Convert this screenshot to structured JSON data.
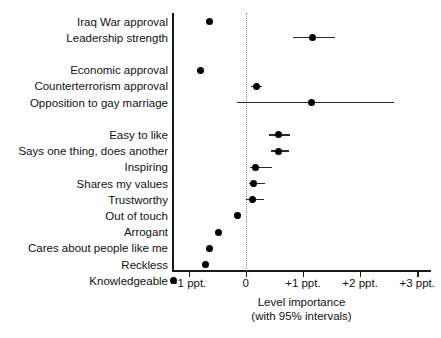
{
  "chart_data": {
    "type": "scatter",
    "title": "",
    "xlabel": "Level importance",
    "xlabel_sub": "(with 95% intervals)",
    "ylabel": "",
    "xlim": [
      -1.29,
      3.24
    ],
    "grid": false,
    "zero_reference_line": 0,
    "legend": "none",
    "xticks": [
      -1,
      0,
      1,
      2,
      3
    ],
    "xtick_labels": [
      "−1 ppt.",
      "0",
      "+1 ppt.",
      "+2 ppt.",
      "+3 ppt."
    ],
    "categories": [
      "Iraq War approval",
      "Leadership strength",
      "Economic approval",
      "Counterterrorism approval",
      "Opposition to gay marriage",
      "Easy to like",
      "Says one thing, does another",
      "Inspiring",
      "Shares my values",
      "Trustworthy",
      "Out of touch",
      "Arrogant",
      "Cares about people like me",
      "Reckless",
      "Knowledgeable"
    ],
    "points": [
      {
        "label": "Iraq War approval",
        "estimate": -0.64,
        "ci_low": -0.69,
        "ci_high": -0.59,
        "row": 0
      },
      {
        "label": "Leadership strength",
        "estimate": 1.17,
        "ci_low": 0.82,
        "ci_high": 1.56,
        "row": 1
      },
      {
        "label": "Economic approval",
        "estimate": -0.8,
        "ci_low": -0.85,
        "ci_high": -0.75,
        "row": 3
      },
      {
        "label": "Counterterrorism approval",
        "estimate": 0.19,
        "ci_low": 0.1,
        "ci_high": 0.28,
        "row": 4
      },
      {
        "label": "Opposition to gay marriage",
        "estimate": 1.15,
        "ci_low": -0.15,
        "ci_high": 2.59,
        "row": 5
      },
      {
        "label": "Easy to like",
        "estimate": 0.57,
        "ci_low": 0.41,
        "ci_high": 0.78,
        "row": 7
      },
      {
        "label": "Says one thing, does another",
        "estimate": 0.58,
        "ci_low": 0.44,
        "ci_high": 0.76,
        "row": 8
      },
      {
        "label": "Inspiring",
        "estimate": 0.17,
        "ci_low": 0.07,
        "ci_high": 0.46,
        "row": 9
      },
      {
        "label": "Shares my values",
        "estimate": 0.14,
        "ci_low": 0.05,
        "ci_high": 0.34,
        "row": 10
      },
      {
        "label": "Trustworthy",
        "estimate": 0.11,
        "ci_low": 0.01,
        "ci_high": 0.32,
        "row": 11
      },
      {
        "label": "Out of touch",
        "estimate": -0.15,
        "ci_low": -0.19,
        "ci_high": -0.11,
        "row": 12
      },
      {
        "label": "Arrogant",
        "estimate": -0.48,
        "ci_low": -0.52,
        "ci_high": -0.44,
        "row": 13
      },
      {
        "label": "Cares about people like me",
        "estimate": -0.64,
        "ci_low": -0.68,
        "ci_high": -0.6,
        "row": 14
      },
      {
        "label": "Reckless",
        "estimate": -0.7,
        "ci_low": -0.74,
        "ci_high": -0.66,
        "row": 15
      },
      {
        "label": "Knowledgeable",
        "estimate": -1.26,
        "ci_low": -1.29,
        "ci_high": -1.23,
        "row": 16
      }
    ],
    "row_slots": 17,
    "colors": {
      "point": "#000000",
      "interval": "#2a2a2a",
      "axis": "#1a1a1a",
      "zero_line": "#8a8a8a",
      "text": "#111111",
      "background": "#ffffff"
    }
  }
}
